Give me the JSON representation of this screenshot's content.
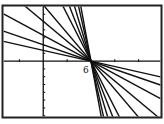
{
  "chart_data": {
    "type": "line",
    "title": "",
    "xlabel": "",
    "ylabel": "",
    "pivot_point": {
      "x": 6,
      "y": 0
    },
    "annotations": [
      {
        "text": "6",
        "x": 6,
        "y": 0,
        "position": "below-left"
      }
    ],
    "xlim": [
      -5,
      14.75
    ],
    "ylim": [
      -7.1,
      7
    ],
    "x_tick_spacing": 3,
    "y_tick_spacing": 1,
    "grid": false,
    "legend": null,
    "series": [
      {
        "name": "line1",
        "slope": -0.23
      },
      {
        "name": "line2",
        "slope": -0.35
      },
      {
        "name": "line3",
        "slope": -0.55
      },
      {
        "name": "line4",
        "slope": -0.85
      },
      {
        "name": "line5",
        "slope": -1.2
      },
      {
        "name": "line6",
        "slope": -2.0
      },
      {
        "name": "line7",
        "slope": -2.6
      },
      {
        "name": "line8",
        "slope": -3.4
      },
      {
        "name": "line9",
        "slope": -4.5
      },
      {
        "name": "line10",
        "slope": -5.5
      }
    ]
  },
  "axis_label_6": "6",
  "colors": {
    "line": "#111111",
    "axis": "#111111",
    "frame": "#222222",
    "background": "#ffffff"
  }
}
